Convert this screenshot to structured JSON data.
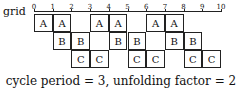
{
  "diagram": {
    "grid_label": "grid",
    "ticks": [
      "0",
      "1",
      "2",
      "3",
      "4",
      "5",
      "6",
      "7",
      "8",
      "9",
      "10"
    ],
    "rows": [
      {
        "label": "A",
        "cells": [
          0,
          1,
          3,
          4,
          6,
          7
        ]
      },
      {
        "label": "B",
        "cells": [
          1,
          2,
          4,
          5,
          7,
          8
        ]
      },
      {
        "label": "C",
        "cells": [
          2,
          3,
          5,
          6,
          8,
          9
        ]
      }
    ],
    "caption": "cycle period = 3, unfolding factor = 2"
  }
}
